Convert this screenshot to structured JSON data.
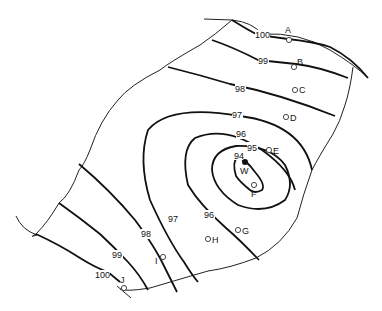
{
  "map": {
    "contours": [
      {
        "value": "100",
        "label_top": "100",
        "label_bottom": "100"
      },
      {
        "value": "99",
        "label_top": "99",
        "label_bottom": "99"
      },
      {
        "value": "98",
        "label_top": "98",
        "label_bottom": "98"
      },
      {
        "value": "97",
        "label_top": "97",
        "label_bottom": "97"
      },
      {
        "value": "96",
        "label_top": "96",
        "label_bottom": "96"
      },
      {
        "value": "95",
        "label": "95"
      },
      {
        "value": "94",
        "label": "94"
      }
    ],
    "points": [
      {
        "id": "A",
        "label": "A"
      },
      {
        "id": "B",
        "label": "B"
      },
      {
        "id": "C",
        "label": "C"
      },
      {
        "id": "D",
        "label": "D"
      },
      {
        "id": "E",
        "label": "E"
      },
      {
        "id": "F",
        "label": "F"
      },
      {
        "id": "G",
        "label": "G"
      },
      {
        "id": "H",
        "label": "H"
      },
      {
        "id": "I",
        "label": "I"
      },
      {
        "id": "J",
        "label": "J"
      }
    ],
    "well": {
      "id": "W",
      "label": "W"
    },
    "colors": {
      "line": "#111111",
      "background": "#ffffff"
    }
  }
}
